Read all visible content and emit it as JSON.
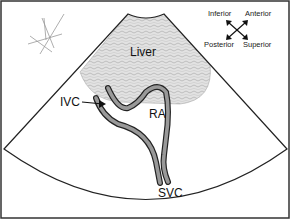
{
  "diagram": {
    "type": "ultrasound-sector-schematic",
    "labels": {
      "liver": "Liver",
      "ra": "RA",
      "ivc": "IVC",
      "svc": "SVC"
    },
    "orientation": {
      "top_left": "Inferior",
      "top_right": "Anterior",
      "bottom_left": "Posterior",
      "bottom_right": "Superior"
    },
    "colors": {
      "line": "#222222",
      "vessel_wall": "#999999",
      "liver_fill": "#d9d9d9",
      "background": "#ffffff"
    }
  }
}
